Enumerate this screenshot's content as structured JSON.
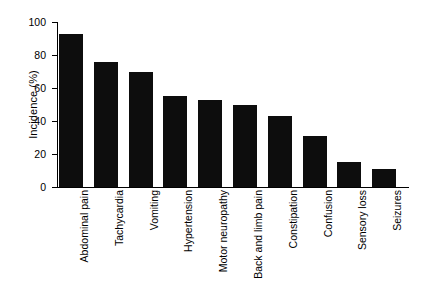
{
  "chart_data": {
    "type": "bar",
    "title": "",
    "xlabel": "",
    "ylabel": "Incidence (%)",
    "ylim": [
      0,
      100
    ],
    "yticks": [
      "0",
      "20",
      "40",
      "60",
      "80",
      "100"
    ],
    "grid": false,
    "legend": false,
    "orientation": "vertical",
    "bar_color": "#0d0d0d",
    "categories": [
      "Abdominal pain",
      "Tachycardia",
      "Vomiting",
      "Hypertension",
      "Motor neuropathy",
      "Back and limb pain",
      "Constipation",
      "Confusion",
      "Sensory loss",
      "Seizures"
    ],
    "values": [
      93,
      76,
      70,
      55,
      53,
      50,
      43,
      31,
      15,
      11
    ]
  }
}
